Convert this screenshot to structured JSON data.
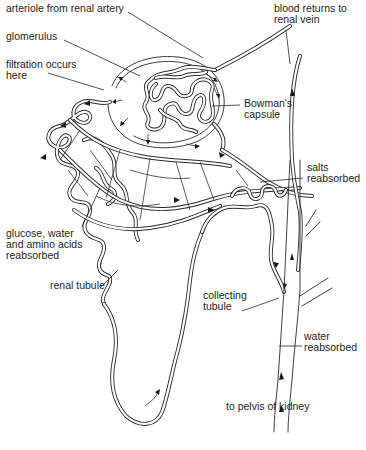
{
  "diagram": {
    "labels": {
      "arteriole": "arteriole from renal artery",
      "glomerulus": "glomerulus",
      "filtration": "filtration occurs\nhere",
      "bowmans_capsule": "Bowman's\ncapsule",
      "blood_returns": "blood returns to\nrenal vein",
      "salts": "salts\nreabsorbed",
      "glucose": "glucose, water\nand amino acids\nreabsorbed",
      "renal_tubule": "renal tubule",
      "collecting_tubule": "collecting\ntubule",
      "water": "water\nreabsorbed",
      "pelvis": "to pelvis of kidney"
    },
    "colors": {
      "ink": "#1e1e1e",
      "background": "#ffffff"
    },
    "structures": [
      "arteriole",
      "glomerulus",
      "bowmans-capsule",
      "capillary-network",
      "proximal-convoluted-tubule",
      "loop-of-henle",
      "distal-convoluted-tubule",
      "collecting-tubule",
      "renal-vein-vessel"
    ]
  }
}
